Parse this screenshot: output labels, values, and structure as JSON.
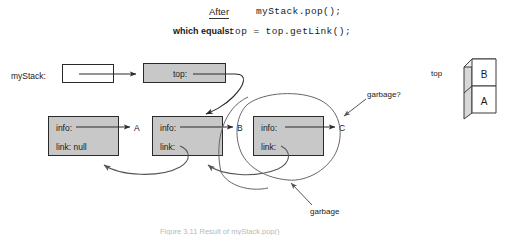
{
  "figure": {
    "heading": {
      "after_label": "After",
      "after_code": "myStack.pop();",
      "which_equals_label": "which equals:",
      "which_equals_code": "top = top.getLink();"
    },
    "variable_label": "myStack:",
    "top_field_label": "top:",
    "nodes": [
      {
        "info_label": "info:",
        "link_label": "link: null",
        "value": "A"
      },
      {
        "info_label": "info:",
        "link_label": "link:",
        "value": "B"
      },
      {
        "info_label": "info:",
        "link_label": "link:",
        "value": "C"
      }
    ],
    "annotations": {
      "garbage_question": "garbage?",
      "garbage": "garbage"
    },
    "stack_picture": {
      "label": "top",
      "cells": [
        "B",
        "A"
      ]
    },
    "caption": "Figure 3.11  Result of myStack.pop()",
    "colors": {
      "node_fill": "#c8c8c8",
      "stroke": "#2a2a2a",
      "curve_stroke": "#555555",
      "caption_color": "#b9b9b9"
    }
  }
}
